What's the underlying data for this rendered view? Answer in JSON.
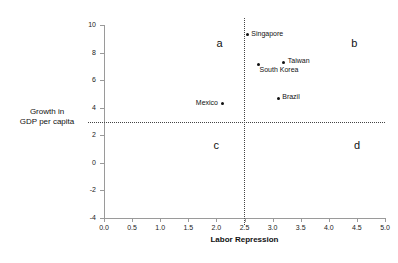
{
  "chart_data": {
    "type": "scatter",
    "title": "",
    "xlabel": "Labor Repression",
    "ylabel": "Growth in GDP per capita",
    "ylabel_lines": [
      "Growth in",
      "GDP per capita"
    ],
    "xlim": [
      0.0,
      5.0
    ],
    "ylim": [
      -4,
      10
    ],
    "grid": false,
    "legend": "none",
    "xticks": [
      "0.0",
      "0.5",
      "1.0",
      "1.5",
      "2.0",
      "2.5",
      "3.0",
      "3.5",
      "4.0",
      "4.5",
      "5.0"
    ],
    "xtick_values": [
      0.0,
      0.5,
      1.0,
      1.5,
      2.0,
      2.5,
      3.0,
      3.5,
      4.0,
      4.5,
      5.0
    ],
    "yticks": [
      "10",
      "8",
      "6",
      "4",
      "2",
      "0",
      "-2",
      "-4"
    ],
    "ytick_values": [
      10,
      8,
      6,
      4,
      2,
      0,
      -2,
      -4
    ],
    "points": [
      {
        "label": "Singapore",
        "x": 2.55,
        "y": 9.3,
        "label_pos": "right"
      },
      {
        "label": "Taiwan",
        "x": 3.2,
        "y": 7.3,
        "label_pos": "right"
      },
      {
        "label": "South Korea",
        "x": 2.75,
        "y": 7.1,
        "label_pos": "below-right"
      },
      {
        "label": "Brazil",
        "x": 3.1,
        "y": 4.7,
        "label_pos": "right"
      },
      {
        "label": "Mexico",
        "x": 2.1,
        "y": 4.3,
        "label_pos": "left"
      }
    ],
    "reference_lines": [
      {
        "orientation": "vertical",
        "value": 2.5,
        "style": "dotted"
      },
      {
        "orientation": "horizontal",
        "value": 3.0,
        "style": "dotted"
      }
    ],
    "annotations": [
      {
        "text": "a",
        "x": 2.0,
        "y": 8.7
      },
      {
        "text": "b",
        "x": 4.4,
        "y": 8.7
      },
      {
        "text": "c",
        "x": 1.95,
        "y": 1.3
      },
      {
        "text": "d",
        "x": 4.45,
        "y": 1.3
      }
    ]
  }
}
